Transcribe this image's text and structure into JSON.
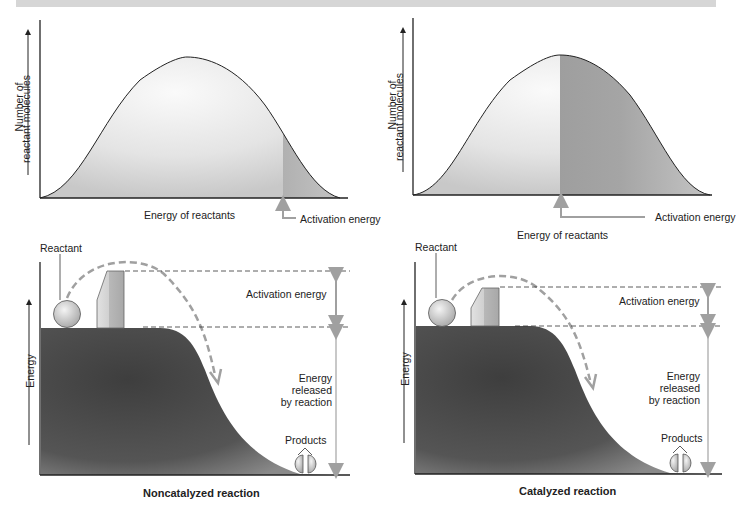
{
  "panels": {
    "top_left": {
      "y_axis_label_line1": "Number of",
      "y_axis_label_line2": "reactant molecules",
      "x_axis_label": "Energy of reactants",
      "activation_label": "Activation energy"
    },
    "top_right": {
      "y_axis_label_line1": "Number of",
      "y_axis_label_line2": "reactant molecules",
      "x_axis_label": "Energy of reactants",
      "activation_label": "Activation energy"
    },
    "bottom_left": {
      "y_axis_label": "Energy",
      "reactant_label": "Reactant",
      "activation_label": "Activation energy",
      "released_line1": "Energy",
      "released_line2": "released",
      "released_line3": "by reaction",
      "products_label": "Products",
      "caption": "Noncatalyzed reaction"
    },
    "bottom_right": {
      "y_axis_label": "Energy",
      "reactant_label": "Reactant",
      "activation_label": "Activation energy",
      "released_line1": "Energy",
      "released_line2": "released",
      "released_line3": "by reaction",
      "products_label": "Products",
      "caption": "Catalyzed reaction"
    }
  },
  "colors": {
    "curve_fill_light": "#e6e6e6",
    "curve_fill_dark": "#9a9a9a",
    "hill_fill": "#4a4a4a",
    "arrow_gray": "#a0a0a0",
    "axis": "#222222"
  }
}
